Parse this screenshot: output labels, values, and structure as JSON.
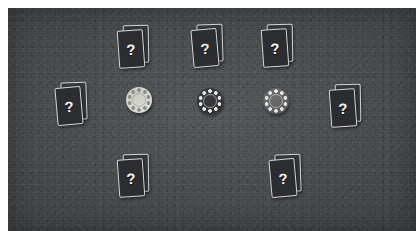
{
  "scene": {
    "name": "poker-table-view",
    "table_color": "#4a4d50",
    "frame_color": "#ffffff",
    "width": 416,
    "height": 231
  },
  "card_back_mark": "?",
  "cards": {
    "face_color": "#2b2d30",
    "border_color": "#d6d7d4",
    "mark_color": "#f2f3f0"
  },
  "seats": [
    {
      "id": "seat-top-left",
      "label": "?",
      "x": 118,
      "y": 25,
      "rotate": -4,
      "cards": 2
    },
    {
      "id": "seat-top-center",
      "label": "?",
      "x": 192,
      "y": 24,
      "rotate": -5,
      "cards": 2
    },
    {
      "id": "seat-top-right",
      "label": "?",
      "x": 262,
      "y": 24,
      "rotate": -4,
      "cards": 2
    },
    {
      "id": "seat-left",
      "label": "?",
      "x": 56,
      "y": 82,
      "rotate": -5,
      "cards": 2
    },
    {
      "id": "seat-right",
      "label": "?",
      "x": 330,
      "y": 84,
      "rotate": -4,
      "cards": 2
    },
    {
      "id": "seat-bottom-left",
      "label": "?",
      "x": 118,
      "y": 154,
      "rotate": -4,
      "cards": 2
    },
    {
      "id": "seat-bottom-right",
      "label": "?",
      "x": 270,
      "y": 154,
      "rotate": -5,
      "cards": 2
    }
  ],
  "chips": [
    {
      "id": "chip-white",
      "color": "#dcdcd6",
      "edge_color": "#8e8f8a",
      "ring_color": "#c9cac3",
      "x": 126,
      "y": 87,
      "value_label": ""
    },
    {
      "id": "chip-black",
      "color": "#2e3033",
      "edge_color": "#e6e7e2",
      "ring_color": "#3a3c3f",
      "x": 197,
      "y": 88,
      "value_label": ""
    },
    {
      "id": "chip-gray",
      "color": "#5a5c5e",
      "edge_color": "#e2e3de",
      "ring_color": "#6d6f71",
      "x": 263,
      "y": 88,
      "value_label": ""
    }
  ]
}
